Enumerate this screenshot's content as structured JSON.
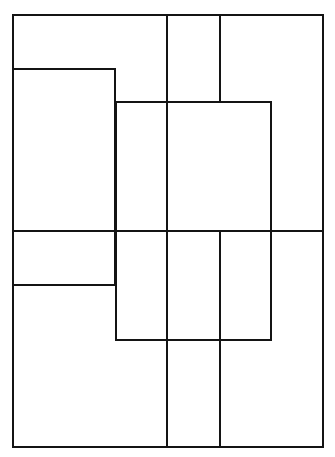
{
  "diagram": {
    "stroke_color": "#141414",
    "background_color": "#ffffff",
    "stroke_width": 2,
    "outer_rect": {
      "x": 12,
      "y": 14,
      "w": 312,
      "h": 434
    },
    "rects": [
      {
        "name": "left-upper-box",
        "x": 12,
        "y": 68,
        "w": 104,
        "h": 218
      },
      {
        "name": "center-box",
        "x": 115,
        "y": 101,
        "w": 157,
        "h": 240
      }
    ],
    "lines": [
      {
        "name": "vertical-divider-1",
        "orientation": "v",
        "x": 167,
        "y1": 14,
        "y2": 448
      },
      {
        "name": "vertical-divider-2-top",
        "orientation": "v",
        "x": 220,
        "y1": 14,
        "y2": 101
      },
      {
        "name": "vertical-divider-2-bottom",
        "orientation": "v",
        "x": 220,
        "y1": 231,
        "y2": 448
      },
      {
        "name": "horizontal-divider-middle",
        "orientation": "h",
        "y": 231,
        "x1": 12,
        "x2": 324
      }
    ],
    "labels": []
  }
}
